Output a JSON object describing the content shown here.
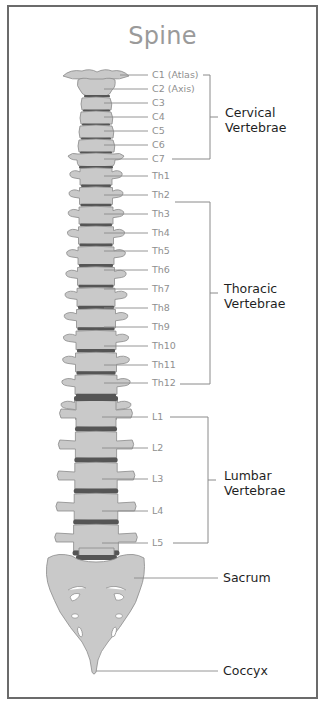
{
  "title": "Spine",
  "colors": {
    "bone": "#c9c9c9",
    "bone_outline": "#8a8a8a",
    "disc": "#555555",
    "leader": "#8a8a8a",
    "label_text": "#8f8f8f",
    "group_text": "#1f1f1f",
    "frame": "#6b6b6b"
  },
  "groups": {
    "cervical": {
      "line1": "Cervical",
      "line2": "Vertebrae",
      "vertebrae": [
        "C1 (Atlas)",
        "C2 (Axis)",
        "C3",
        "C4",
        "C5",
        "C6",
        "C7"
      ]
    },
    "thoracic": {
      "line1": "Thoracic",
      "line2": "Vertebrae",
      "vertebrae": [
        "Th1",
        "Th2",
        "Th3",
        "Th4",
        "Th5",
        "Th6",
        "Th7",
        "Th8",
        "Th9",
        "Th10",
        "Th11",
        "Th12"
      ]
    },
    "lumbar": {
      "line1": "Lumbar",
      "line2": "Vertebrae",
      "vertebrae": [
        "L1",
        "L2",
        "L3",
        "L4",
        "L5"
      ]
    }
  },
  "sacrum": "Sacrum",
  "coccyx": "Coccyx"
}
